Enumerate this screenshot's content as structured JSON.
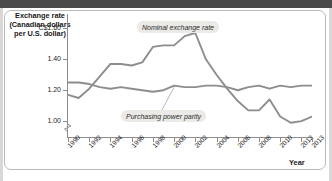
{
  "figure": {
    "y_axis_title": "Exchange rate\n(Canadian dollars\nper U.S. dollar)",
    "y_axis_title_line1": "Exchange rate",
    "y_axis_title_line2": "(Canadian dollars",
    "y_axis_title_line3": "per U.S. dollar)",
    "x_axis_title": "Year",
    "line_color": "#8d8d8d",
    "axis_color": "#8d8d8d",
    "callout_bg": "#eceae6"
  },
  "chart_data": {
    "type": "line",
    "title": "",
    "xlabel": "Year",
    "ylabel": "Exchange rate (Canadian dollars per U.S. dollar)",
    "grid": false,
    "legend_position": "inline-callout",
    "xlim": [
      1990,
      2013
    ],
    "ylim": [
      0.93,
      1.68
    ],
    "y_ticks": [
      1.0,
      1.2,
      1.4,
      1.6
    ],
    "y_tick_labels": [
      "1.00",
      "1.20",
      "1.40",
      "C$1.60"
    ],
    "x_ticks": [
      1990,
      1992,
      1994,
      1996,
      1998,
      2000,
      2002,
      2004,
      2006,
      2008,
      2010,
      2012,
      2013
    ],
    "x_tick_labels": [
      "1990",
      "1992",
      "1994",
      "1996",
      "1998",
      "2000",
      "2002",
      "2004",
      "2006",
      "2008",
      "2010",
      "2012",
      "2013"
    ],
    "axis_break_below": 1.0,
    "annotations": [
      {
        "text": "Nominal exchange rate",
        "points_to_year": 2001,
        "points_to_value": 1.55
      },
      {
        "text": "Purchasing power parity",
        "points_to_year": 2000,
        "points_to_value": 1.22
      }
    ],
    "x": [
      1990,
      1991,
      1992,
      1993,
      1994,
      1995,
      1996,
      1997,
      1998,
      1999,
      2000,
      2001,
      2002,
      2003,
      2004,
      2005,
      2006,
      2007,
      2008,
      2009,
      2010,
      2011,
      2012,
      2013
    ],
    "series": [
      {
        "name": "Nominal exchange rate",
        "values": [
          1.17,
          1.15,
          1.21,
          1.29,
          1.37,
          1.37,
          1.36,
          1.38,
          1.48,
          1.49,
          1.49,
          1.55,
          1.57,
          1.4,
          1.3,
          1.21,
          1.13,
          1.07,
          1.07,
          1.14,
          1.03,
          0.99,
          1.0,
          1.03
        ]
      },
      {
        "name": "Purchasing power parity",
        "values": [
          1.25,
          1.25,
          1.24,
          1.22,
          1.21,
          1.22,
          1.21,
          1.2,
          1.19,
          1.2,
          1.23,
          1.22,
          1.22,
          1.23,
          1.23,
          1.22,
          1.2,
          1.22,
          1.23,
          1.21,
          1.23,
          1.22,
          1.23,
          1.23
        ]
      }
    ]
  }
}
